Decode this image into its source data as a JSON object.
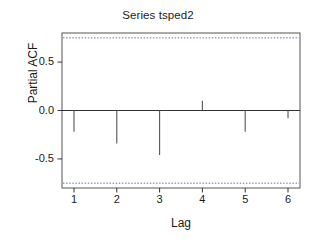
{
  "chart_data": {
    "type": "bar",
    "title": "Series tsped2",
    "xlabel": "Lag",
    "ylabel": "Partial ACF",
    "categories": [
      1,
      2,
      3,
      4,
      5,
      6
    ],
    "values": [
      -0.22,
      -0.34,
      -0.46,
      0.1,
      -0.22,
      -0.08
    ],
    "series": [
      {
        "name": "Partial ACF",
        "values": [
          -0.22,
          -0.34,
          -0.46,
          0.1,
          -0.22,
          -0.08
        ]
      }
    ],
    "xlim": [
      0.72,
      6.28
    ],
    "ylim": [
      -0.8,
      0.8
    ],
    "xticks": [
      1,
      2,
      3,
      4,
      5,
      6
    ],
    "xtick_labels": [
      "1",
      "2",
      "3",
      "4",
      "5",
      "6"
    ],
    "yticks": [
      0.5,
      0.0,
      -0.5
    ],
    "ytick_labels": [
      "0.5",
      "0.0",
      "-0.5"
    ],
    "grid": false,
    "legend": false,
    "zero_line": 0.0,
    "confidence_bands": {
      "upper": 0.75,
      "lower": -0.75,
      "style": "dashed",
      "color": "#3b5fa8"
    },
    "colors": {
      "spike": "#555555",
      "axis": "#333333",
      "frame": "#555555",
      "background": "#ffffff"
    }
  }
}
